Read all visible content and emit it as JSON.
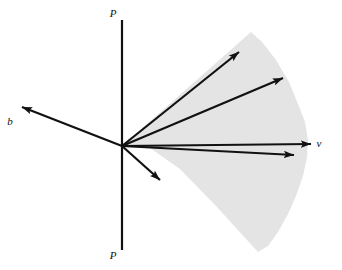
{
  "figure": {
    "background_color": "#ffffff",
    "line_color": "#111111",
    "cone_fill_color": "#e4e4e4",
    "width": 342,
    "height": 270
  },
  "axis": {
    "name": "vertical-axis-P",
    "x": 122,
    "y_top": 20,
    "y_bottom": 250,
    "stroke_width": 2.2,
    "label_top": {
      "text": "P",
      "x": 113,
      "y": 17
    },
    "label_bottom": {
      "text": "P",
      "x": 113,
      "y": 259
    }
  },
  "origin": {
    "x": 122,
    "y": 146
  },
  "vectors": [
    {
      "id": "vector-b",
      "label": "b",
      "label_x": 10,
      "label_y": 125,
      "tip_x": 22,
      "tip_y": 107,
      "in_cone": false
    },
    {
      "id": "vector-upper-steep",
      "label": "",
      "tip_x": 239,
      "tip_y": 52,
      "in_cone": true
    },
    {
      "id": "vector-upper-shallow",
      "label": "",
      "tip_x": 283,
      "tip_y": 78,
      "in_cone": true
    },
    {
      "id": "vector-v",
      "label": "v",
      "label_x": 319,
      "label_y": 147,
      "tip_x": 311,
      "tip_y": 144,
      "in_cone": true
    },
    {
      "id": "vector-lower-shallow",
      "label": "",
      "tip_x": 294,
      "tip_y": 155,
      "in_cone": true
    },
    {
      "id": "vector-lower-diagonal",
      "label": "",
      "tip_x": 160,
      "tip_y": 180,
      "in_cone": true
    }
  ],
  "cone_region": {
    "name": "shaded-cone-region",
    "fill": "#e4e4e4",
    "apex_x": 122,
    "apex_y": 146,
    "outline_points": "122,146 251,32 262,42 276,60 289,82 298,104 305,122 308,140 307,157 303,176 296,196 288,214 278,232 268,246 258,252 216,206 180,169 150,148"
  }
}
